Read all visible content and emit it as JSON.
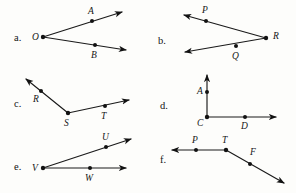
{
  "page": {
    "background_color": "#fdfdfb",
    "ink_color": "#121212",
    "width": 296,
    "height": 193
  },
  "items": [
    {
      "key": "a",
      "label": "a.",
      "label_x": 14,
      "label_y": 41,
      "vertex": {
        "name": "O",
        "x": 43,
        "y": 37,
        "label_x": 32,
        "label_y": 40
      },
      "rays": [
        {
          "from": [
            43,
            37
          ],
          "to": [
            122,
            12
          ],
          "point": {
            "name": "A",
            "x": 92,
            "y": 21,
            "label_x": 88,
            "label_y": 14
          }
        },
        {
          "from": [
            43,
            37
          ],
          "to": [
            126,
            50
          ],
          "point": {
            "name": "B",
            "x": 95,
            "y": 45,
            "label_x": 91,
            "label_y": 58
          }
        }
      ]
    },
    {
      "key": "b",
      "label": "b.",
      "label_x": 158,
      "label_y": 44,
      "vertex": {
        "name": "R",
        "x": 266,
        "y": 38,
        "label_x": 273,
        "label_y": 39
      },
      "rays": [
        {
          "from": [
            266,
            38
          ],
          "to": [
            184,
            15
          ],
          "point": {
            "name": "P",
            "x": 206,
            "y": 21,
            "label_x": 202,
            "label_y": 13
          }
        },
        {
          "from": [
            266,
            38
          ],
          "to": [
            185,
            52
          ],
          "point": {
            "name": "Q",
            "x": 236,
            "y": 46,
            "label_x": 232,
            "label_y": 59
          }
        }
      ]
    },
    {
      "key": "c",
      "label": "c.",
      "label_x": 14,
      "label_y": 107,
      "vertex": {
        "name": "S",
        "x": 68,
        "y": 113,
        "label_x": 64,
        "label_y": 126
      },
      "rays": [
        {
          "from": [
            68,
            113
          ],
          "to": [
            26,
            79
          ],
          "point": {
            "name": "R",
            "x": 41,
            "y": 91,
            "label_x": 33,
            "label_y": 102
          }
        },
        {
          "from": [
            68,
            113
          ],
          "to": [
            129,
            100
          ],
          "point": {
            "name": "T",
            "x": 105,
            "y": 106,
            "label_x": 101,
            "label_y": 119
          }
        }
      ]
    },
    {
      "key": "d",
      "label": "d.",
      "label_x": 160,
      "label_y": 109,
      "vertex": {
        "name": "C",
        "x": 207,
        "y": 117,
        "label_x": 197,
        "label_y": 126
      },
      "rays": [
        {
          "from": [
            207,
            117
          ],
          "to": [
            207,
            75
          ],
          "point": {
            "name": "A",
            "x": 207,
            "y": 92,
            "label_x": 197,
            "label_y": 94
          }
        },
        {
          "from": [
            207,
            117
          ],
          "to": [
            276,
            117
          ],
          "point": {
            "name": "D",
            "x": 245,
            "y": 117,
            "label_x": 241,
            "label_y": 129
          }
        }
      ]
    },
    {
      "key": "e",
      "label": "e.",
      "label_x": 14,
      "label_y": 170,
      "vertex": {
        "name": "V",
        "x": 43,
        "y": 168,
        "label_x": 32,
        "label_y": 171
      },
      "rays": [
        {
          "from": [
            43,
            168
          ],
          "to": [
            131,
            139
          ],
          "point": {
            "name": "U",
            "x": 106,
            "y": 147,
            "label_x": 102,
            "label_y": 140
          }
        },
        {
          "from": [
            43,
            168
          ],
          "to": [
            126,
            168
          ],
          "point": {
            "name": "W",
            "x": 90,
            "y": 168,
            "label_x": 85,
            "label_y": 181
          }
        }
      ]
    },
    {
      "key": "f",
      "label": "f.",
      "label_x": 160,
      "label_y": 163,
      "vertex": {
        "name": "T",
        "x": 226,
        "y": 150,
        "label_x": 222,
        "label_y": 143
      },
      "rays": [
        {
          "from": [
            226,
            150
          ],
          "to": [
            172,
            150
          ],
          "point": {
            "name": "P",
            "x": 196,
            "y": 150,
            "label_x": 192,
            "label_y": 143
          }
        },
        {
          "from": [
            226,
            150
          ],
          "to": [
            284,
            183
          ],
          "point": {
            "name": "F",
            "x": 250,
            "y": 164,
            "label_x": 250,
            "label_y": 155
          }
        }
      ]
    }
  ]
}
